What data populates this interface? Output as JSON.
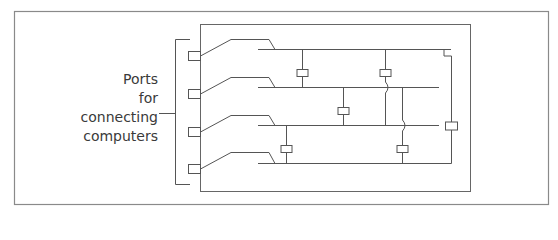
{
  "diagram": {
    "type": "network-switch-schematic",
    "colors": {
      "line": "#555555",
      "border": "#8a8a8a",
      "text": "#3a3a3a",
      "background": "#ffffff"
    },
    "label": {
      "lines": [
        "Ports",
        "for",
        "connecting",
        "computers"
      ]
    },
    "outer_frame": {
      "x": 14,
      "y": 11,
      "w": 534,
      "h": 193
    },
    "device_box": {
      "x": 200,
      "y": 24,
      "w": 270,
      "h": 167
    },
    "bracket": {
      "x": 175,
      "top": 39,
      "bottom": 184,
      "tick_end": 190,
      "pointer_y": 113,
      "pointer_start": 159
    },
    "ports": [
      {
        "id": 1,
        "y": 56
      },
      {
        "id": 2,
        "y": 94
      },
      {
        "id": 3,
        "y": 132
      },
      {
        "id": 4,
        "y": 169
      }
    ],
    "buses": [
      {
        "id": 1,
        "y": 49,
        "x_start": 258,
        "x_end": 451
      },
      {
        "id": 2,
        "y": 87,
        "x_start": 258,
        "x_end": 439
      },
      {
        "id": 3,
        "y": 125,
        "x_start": 258,
        "x_end": 439
      },
      {
        "id": 4,
        "y": 163,
        "x_start": 258,
        "x_end": 451
      }
    ],
    "links": [
      {
        "x": 302,
        "from_y": 49,
        "to_y": 87,
        "box_y": 73,
        "hops": []
      },
      {
        "x": 385,
        "from_y": 49,
        "to_y": 125,
        "box_y": 73,
        "hops": [
          87
        ]
      },
      {
        "x": 343,
        "from_y": 87,
        "to_y": 125,
        "box_y": 111,
        "hops": []
      },
      {
        "x": 286,
        "from_y": 125,
        "to_y": 163,
        "box_y": 149,
        "hops": []
      },
      {
        "x": 402,
        "from_y": 87,
        "to_y": 163,
        "box_y": 149,
        "hops": [
          125
        ]
      },
      {
        "x": 451,
        "from_y": 56,
        "to_y": 163,
        "box_y": 126,
        "hops": []
      }
    ]
  }
}
